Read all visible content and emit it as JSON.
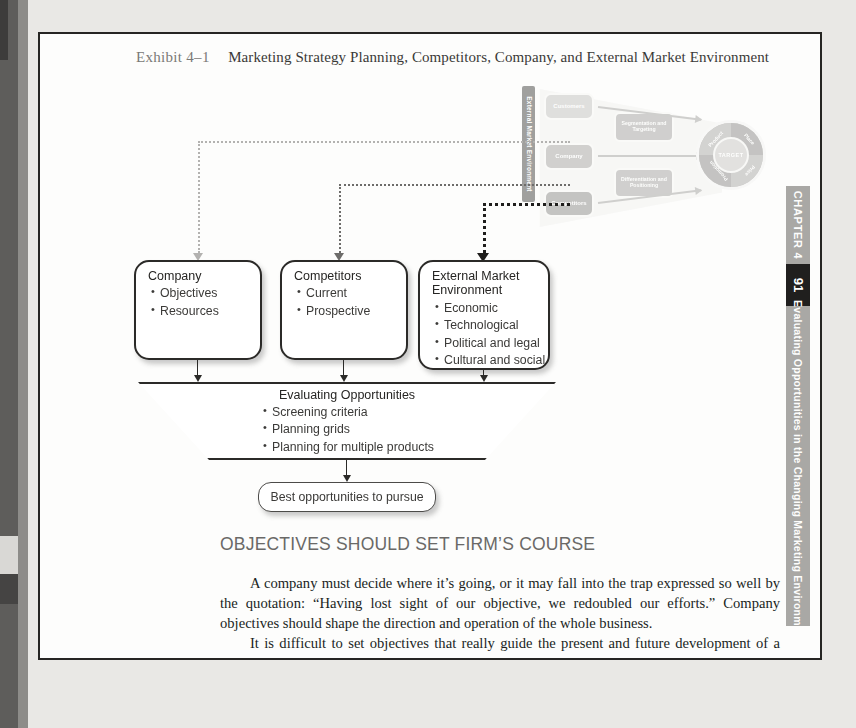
{
  "exhibit": {
    "label": "Exhibit 4–1",
    "title": "Marketing Strategy Planning, Competitors, Company, and External Market Environment"
  },
  "hero_graphic": {
    "environment_bar": "External Market Environment",
    "customer_boxes": [
      "Customers",
      "Company",
      "Competitors"
    ],
    "strategy_boxes": [
      "Segmentation and Targeting",
      "Differentiation and Positioning"
    ],
    "target_center": "TARGET",
    "four_ps": [
      "Product",
      "Place",
      "Promotion",
      "Price"
    ]
  },
  "flow": {
    "company": {
      "title": "Company",
      "items": [
        "Objectives",
        "Resources"
      ]
    },
    "competitors": {
      "title": "Competitors",
      "items": [
        "Current",
        "Prospective"
      ]
    },
    "external": {
      "title_line1": "External Market",
      "title_line2": "Environment",
      "items": [
        "Economic",
        "Technological",
        "Political and legal",
        "Cultural and social"
      ]
    },
    "funnel": {
      "title": "Evaluating Opportunities",
      "items": [
        "Screening criteria",
        "Planning grids",
        "Planning for multiple products"
      ]
    },
    "outcome": "Best opportunities to pursue"
  },
  "section": {
    "heading": "OBJECTIVES SHOULD SET FIRM’S COURSE",
    "paragraphs": [
      "A company must decide where it’s going, or it may fall into the trap expressed so well by the quotation: “Having lost sight of our objective, we redoubled our efforts.” Company objectives should shape the direction and operation of the whole business.",
      "It is difficult to set objectives that really guide the present and future development of a company. The marketing manager should be heard when the company is setting objectives. But setting whole-company objectives—within resource limits—is ulti-"
    ]
  },
  "chapter_tab": {
    "chapter": "CHAPTER 4",
    "page_number": "91",
    "running_title": "Evaluating Opportunities in the Changing Marketing Environme"
  },
  "colors": {
    "ink": "#262523",
    "paper": "#fdfdfc",
    "tab_grey": "#a9a8a5",
    "tab_black": "#201f1e",
    "heading_grey": "#6a6967"
  }
}
